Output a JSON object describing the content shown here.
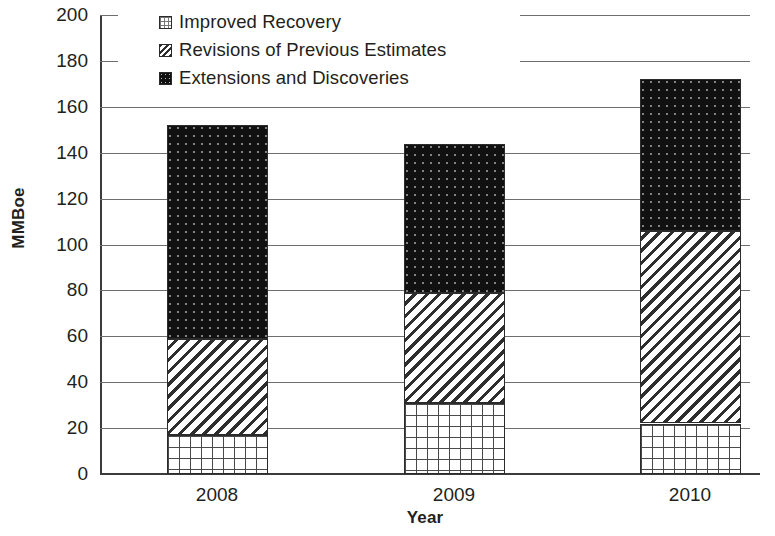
{
  "chart_data": {
    "type": "bar",
    "subtype": "stacked",
    "title": "",
    "xlabel": "Year",
    "ylabel": "MMBoe",
    "categories": [
      "2008",
      "2009",
      "2010"
    ],
    "series": [
      {
        "name": "Improved Recovery",
        "values": [
          17,
          31,
          22
        ],
        "pattern": "grid",
        "color": "#ffffff"
      },
      {
        "name": "Revisions of Previous Estimates",
        "values": [
          42,
          48,
          84
        ],
        "pattern": "diagonal-hatch",
        "color": "#ffffff"
      },
      {
        "name": "Extensions and Discoveries",
        "values": [
          93,
          65,
          66
        ],
        "pattern": "dots",
        "color": "#111111"
      }
    ],
    "totals": [
      152,
      144,
      172
    ],
    "ylim": [
      0,
      200
    ],
    "ytick_labels": [
      "0",
      "20",
      "40",
      "60",
      "80",
      "100",
      "120",
      "140",
      "160",
      "180",
      "200"
    ],
    "ytick_values": [
      0,
      20,
      40,
      60,
      80,
      100,
      120,
      140,
      160,
      180,
      200
    ],
    "grid": true,
    "grid_axis": "y",
    "legend_position": "top-left-inside"
  },
  "axes": {
    "y_title": "MMBoe",
    "x_title": "Year"
  },
  "legend": {
    "items": [
      {
        "label": "Improved Recovery",
        "swatch": "grid-swatch-icon"
      },
      {
        "label": "Revisions of Previous Estimates",
        "swatch": "diagonal-hatch-swatch-icon"
      },
      {
        "label": "Extensions and Discoveries",
        "swatch": "dotted-black-swatch-icon"
      }
    ]
  }
}
